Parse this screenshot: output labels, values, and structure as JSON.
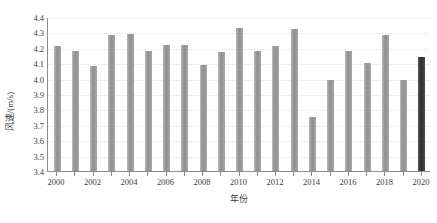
{
  "chart_data": {
    "type": "bar",
    "title": "",
    "xlabel": "年份",
    "ylabel": "风速/(m/s)",
    "ylim": [
      3.4,
      4.4
    ],
    "ytick_labels": [
      "4.4",
      "4.3",
      "4.2",
      "4.1",
      "4.0",
      "3.9",
      "3.8",
      "3.7",
      "3.6",
      "3.5",
      "3.4"
    ],
    "yticks": [
      4.4,
      4.3,
      4.2,
      4.1,
      4.0,
      3.9,
      3.8,
      3.7,
      3.6,
      3.5,
      3.4
    ],
    "grid": true,
    "legend": "none",
    "categories": [
      2000,
      2001,
      2002,
      2003,
      2004,
      2005,
      2006,
      2007,
      2008,
      2009,
      2010,
      2011,
      2012,
      2013,
      2014,
      2015,
      2016,
      2017,
      2018,
      2019,
      2020
    ],
    "xtick_labels": [
      "2000",
      "2002",
      "2004",
      "2006",
      "2008",
      "2010",
      "2012",
      "2014",
      "2016",
      "2018",
      "2020"
    ],
    "values": [
      4.21,
      4.18,
      4.08,
      4.28,
      4.29,
      4.18,
      4.22,
      4.22,
      4.09,
      4.17,
      4.33,
      4.18,
      4.21,
      4.32,
      3.75,
      3.99,
      4.18,
      4.1,
      4.28,
      3.99,
      4.14
    ],
    "bar_colors": [
      "#9a9a9a",
      "#9a9a9a",
      "#9a9a9a",
      "#9a9a9a",
      "#9a9a9a",
      "#9a9a9a",
      "#9a9a9a",
      "#9a9a9a",
      "#9a9a9a",
      "#9a9a9a",
      "#9a9a9a",
      "#9a9a9a",
      "#9a9a9a",
      "#9a9a9a",
      "#9a9a9a",
      "#9a9a9a",
      "#9a9a9a",
      "#9a9a9a",
      "#9a9a9a",
      "#9a9a9a",
      "#333333"
    ],
    "highlight_category": 2020,
    "series_color": "#9a9a9a",
    "highlight_color": "#333333",
    "axis_color": "#8c8c8c",
    "grid_color": "#f0f0f0",
    "text_color": "#3d3d3d"
  }
}
